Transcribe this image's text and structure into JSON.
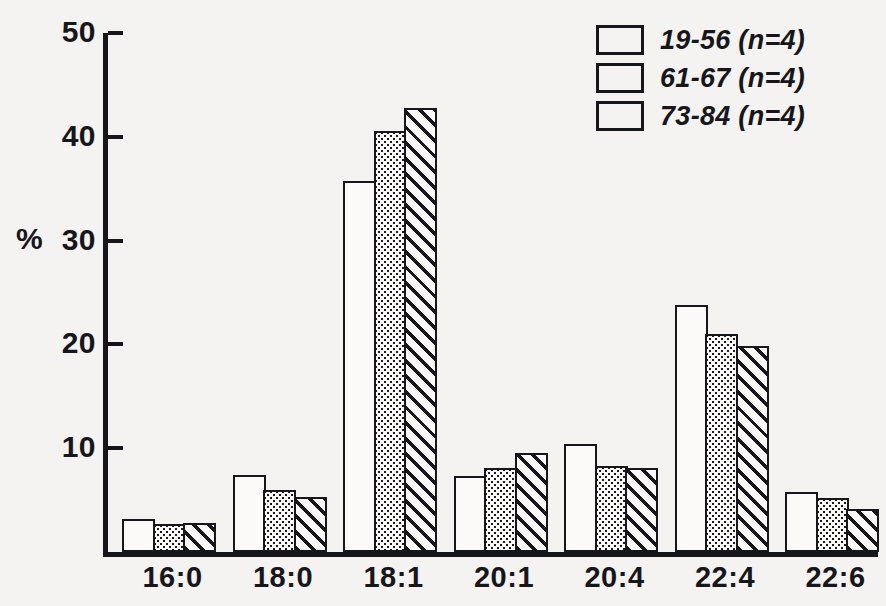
{
  "chart_data": {
    "type": "bar",
    "title": "",
    "subtitle": "",
    "xlabel": "",
    "ylabel": "%",
    "ylim": [
      0,
      50
    ],
    "yticks": [
      10,
      20,
      30,
      40,
      50
    ],
    "ytick_labels": [
      "10",
      "20",
      "30",
      "40",
      "50"
    ],
    "grid": false,
    "legend_position": "top-right",
    "categories": [
      "16:0",
      "18:0",
      "18:1",
      "20:1",
      "20:4",
      "22:4",
      "22:6"
    ],
    "series": [
      {
        "name": "19-56 (n=4)",
        "fill": "open",
        "values": [
          3.2,
          7.4,
          35.7,
          7.3,
          10.4,
          23.8,
          5.8
        ]
      },
      {
        "name": "61-67 (n=4)",
        "fill": "dotted",
        "values": [
          2.7,
          6.0,
          40.6,
          8.1,
          8.3,
          21.0,
          5.2
        ]
      },
      {
        "name": "73-84 (n=4)",
        "fill": "hatched",
        "values": [
          2.8,
          5.3,
          42.8,
          9.5,
          8.1,
          19.8,
          4.1
        ]
      }
    ]
  },
  "axis": {
    "y_label": "%",
    "y_tick_labels": [
      "50",
      "40",
      "30",
      "20",
      "10"
    ],
    "x_tick_labels": [
      "16:0",
      "18:0",
      "18:1",
      "20:1",
      "20:4",
      "22:4",
      "22:6"
    ]
  },
  "legend": {
    "entries": [
      {
        "label": "19-56 (n=4)",
        "pattern": "open"
      },
      {
        "label": "61-67 (n=4)",
        "pattern": "dotted"
      },
      {
        "label": "73-84 (n=4)",
        "pattern": "hatched"
      }
    ]
  },
  "colors": {
    "ink": "#17161a",
    "paper": "#f4f3f1",
    "bar_face": "#fbfaf8"
  }
}
